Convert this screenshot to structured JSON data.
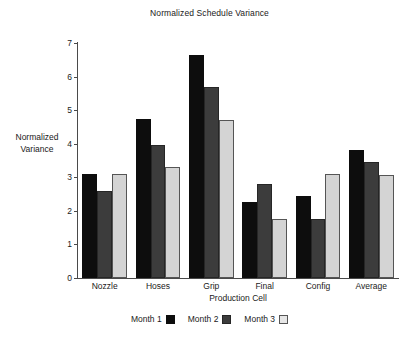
{
  "chart_data": {
    "type": "bar",
    "title": "Normalized Schedule Variance",
    "xlabel": "Production Cell",
    "ylabel_line1": "Normalized",
    "ylabel_line2": "Variance",
    "ylabel": "Normalized Variance",
    "categories": [
      "Nozzle",
      "Hoses",
      "Grip",
      "Final",
      "Config",
      "Average"
    ],
    "series": [
      {
        "name": "Month 1",
        "color": "#0d0d0d",
        "values": [
          3.1,
          4.75,
          6.65,
          2.25,
          2.45,
          3.8
        ]
      },
      {
        "name": "Month 2",
        "color": "#3c3c3c",
        "values": [
          2.6,
          3.97,
          5.7,
          2.8,
          1.75,
          3.45
        ]
      },
      {
        "name": "Month 3",
        "color": "#d4d4d4",
        "values": [
          3.1,
          3.3,
          4.7,
          1.75,
          3.1,
          3.08
        ]
      }
    ],
    "ylim": [
      0,
      7
    ],
    "yticks": [
      0,
      1,
      2,
      3,
      4,
      5,
      6,
      7
    ],
    "ytick_labels": [
      "0",
      "1",
      "2",
      "3",
      "4",
      "5",
      "6",
      "7"
    ],
    "grid": false,
    "legend_position": "bottom"
  }
}
